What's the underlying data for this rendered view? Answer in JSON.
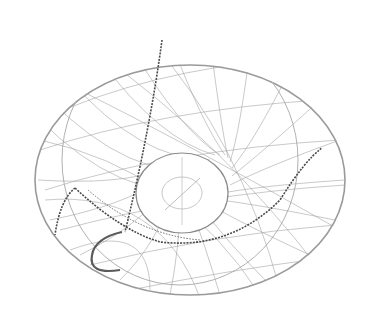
{
  "image": {
    "subject": "wire crab net with chains",
    "background_color": "#ffffff",
    "net_color": "#8a8a8a",
    "chain_color": "#4a4a4a",
    "hook_color": "#5a5a5a"
  }
}
